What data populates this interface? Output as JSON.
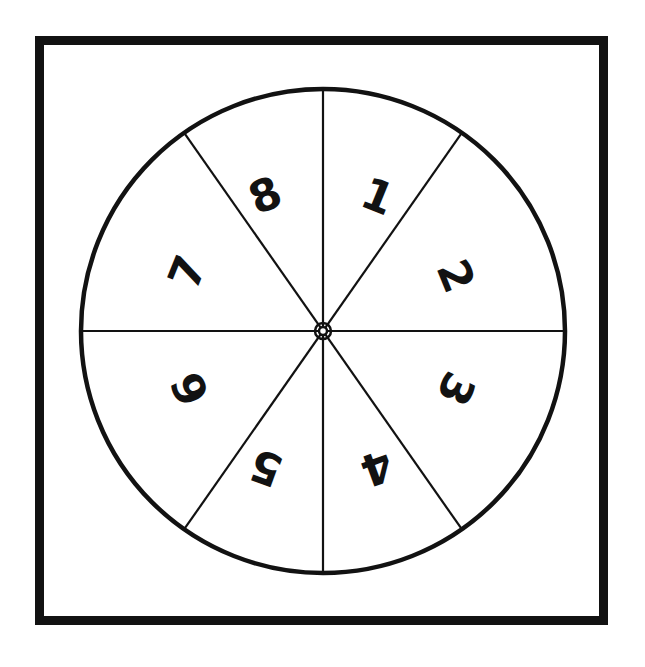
{
  "figure": {
    "kind": "spinner-wheel-diagram",
    "background_color": "#ffffff",
    "ink_color": "#121212",
    "frame": {
      "name": "outer-frame",
      "x": 35,
      "y": 36,
      "width": 573,
      "height": 589,
      "stroke_width": 9,
      "stroke_color": "#121212",
      "fill": "#ffffff"
    },
    "wheel": {
      "name": "spinner-wheel",
      "center_x": 323,
      "center_y": 331,
      "radius": 242,
      "stroke_width": 4.5,
      "stroke_color": "#121212",
      "fill": "#ffffff",
      "sector_count": 8,
      "spoke_stroke_width": 2.2,
      "hub": {
        "name": "spinner-hub",
        "outer_radius": 8,
        "inner_radius": 4,
        "stroke_width": 2.5
      }
    },
    "spokes": [
      {
        "name": "spoke-vertical",
        "angle_deg": 90
      },
      {
        "name": "spoke-horizontal",
        "angle_deg": 0
      },
      {
        "name": "spoke-diagonal-ne-sw",
        "angle_deg": 55
      },
      {
        "name": "spoke-diagonal-nw-se",
        "angle_deg": 125
      }
    ],
    "sectors": [
      {
        "name": "sector-1",
        "label": "1",
        "cx": 378,
        "cy": 196,
        "rotation_deg": 22
      },
      {
        "name": "sector-2",
        "label": "2",
        "cx": 456,
        "cy": 276,
        "rotation_deg": 68
      },
      {
        "name": "sector-3",
        "label": "3",
        "cx": 456,
        "cy": 389,
        "rotation_deg": 115
      },
      {
        "name": "sector-4",
        "label": "4",
        "cx": 377,
        "cy": 468,
        "rotation_deg": 160
      },
      {
        "name": "sector-5",
        "label": "5",
        "cx": 266,
        "cy": 468,
        "rotation_deg": 200
      },
      {
        "name": "sector-6",
        "label": "6",
        "cx": 190,
        "cy": 389,
        "rotation_deg": 245
      },
      {
        "name": "sector-7",
        "label": "7",
        "cx": 187,
        "cy": 272,
        "rotation_deg": 292
      },
      {
        "name": "sector-8",
        "label": "8",
        "cx": 265,
        "cy": 195,
        "rotation_deg": 337
      }
    ]
  }
}
